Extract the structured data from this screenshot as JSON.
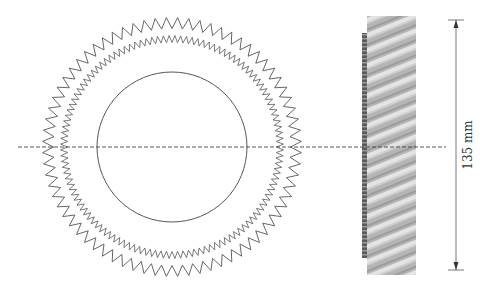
{
  "diagram": {
    "type": "gear-drawing",
    "front_view": {
      "center": [
        172,
        147
      ],
      "outer_ring": {
        "radius": 124,
        "amplitude": 5.5,
        "teeth": 72,
        "stroke": "#555555"
      },
      "inner_ring": {
        "radius": 108,
        "amplitude": 3.5,
        "teeth": 120,
        "stroke": "#555555"
      },
      "bore_circle": {
        "radius": 75,
        "stroke": "#444444"
      }
    },
    "centerline": {
      "y": 147,
      "x1": 18,
      "x2": 446,
      "stroke": "#444444"
    },
    "side_view": {
      "x": 367,
      "y": 16,
      "width": 49,
      "height": 259,
      "strip": {
        "x": 362,
        "y": 33,
        "width": 6,
        "height": 225
      },
      "base_color": "#b8b8b8",
      "stripe_color": "#e6e6e6",
      "dark_color": "#6a6a6a"
    },
    "dimension": {
      "x": 456,
      "y1": 20,
      "y2": 270,
      "label": "135 mm",
      "stroke": "#555555"
    }
  }
}
